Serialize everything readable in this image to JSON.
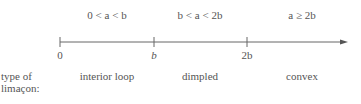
{
  "diagram": {
    "conditions": [
      {
        "text": "0 < a < b"
      },
      {
        "text": "b < a < 2b"
      },
      {
        "text": "a ≥ 2b"
      }
    ],
    "ticks": [
      {
        "label": "0"
      },
      {
        "label": "b"
      },
      {
        "label": "2b"
      }
    ],
    "row_label_line1": "type of",
    "row_label_line2": "limaçon:",
    "regions": [
      {
        "label": "interior loop"
      },
      {
        "label": "dimpled"
      },
      {
        "label": "convex"
      }
    ],
    "colors": {
      "line": "#555555",
      "text": "#555555"
    }
  }
}
